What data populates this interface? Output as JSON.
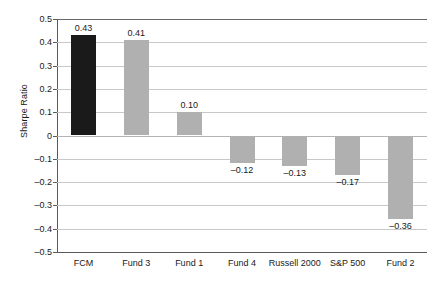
{
  "chart_data": {
    "type": "bar",
    "title": "",
    "subtitle": "",
    "xlabel": "",
    "ylabel": "Sharpe Ratio",
    "categories": [
      "FCM",
      "Fund 3",
      "Fund 1",
      "Fund 4",
      "Russell 2000",
      "S&P 500",
      "Fund 2"
    ],
    "values": [
      0.43,
      0.41,
      0.1,
      -0.12,
      -0.13,
      -0.17,
      -0.36
    ],
    "data_labels": [
      "0.43",
      "0.41",
      "0.10",
      "–0.12",
      "–0.13",
      "–0.17",
      "–0.36"
    ],
    "bar_colors": [
      "#1a1a1a",
      "#b0b0b0",
      "#b0b0b0",
      "#b0b0b0",
      "#b0b0b0",
      "#b0b0b0",
      "#b0b0b0"
    ],
    "ylim": [
      -0.5,
      0.5
    ],
    "ytick_values": [
      0.5,
      0.4,
      0.3,
      0.2,
      0.1,
      0,
      -0.1,
      -0.2,
      -0.3,
      -0.4,
      -0.5
    ],
    "ytick_labels": [
      "0.5",
      "0.4",
      "0.3",
      "0.2",
      "0.1",
      "0",
      "–0.1",
      "–0.2",
      "–0.3",
      "–0.4",
      "–0.5"
    ],
    "grid": true,
    "legend": "none",
    "highlight_category": "FCM",
    "gridline_color": "#c8c8c8",
    "axis_color": "#5a5a5a",
    "background_color": "#ffffff"
  }
}
